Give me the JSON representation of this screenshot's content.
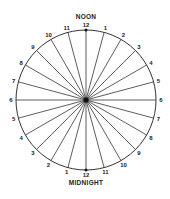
{
  "diagram": {
    "title_top": "NOON",
    "title_bottom": "MIDNIGHT",
    "center": {
      "x": 86,
      "y": 100
    },
    "radius": 70,
    "spoke_count": 24,
    "colors": {
      "line": "#333333",
      "text": "#222222",
      "hub": "#111111"
    },
    "hour_labels": [
      {
        "angle": 0,
        "text": "12"
      },
      {
        "angle": 15,
        "text": "1"
      },
      {
        "angle": 30,
        "text": "2"
      },
      {
        "angle": 45,
        "text": "3"
      },
      {
        "angle": 60,
        "text": "4"
      },
      {
        "angle": 75,
        "text": "5"
      },
      {
        "angle": 90,
        "text": "6"
      },
      {
        "angle": 105,
        "text": "7"
      },
      {
        "angle": 120,
        "text": "8"
      },
      {
        "angle": 135,
        "text": "9"
      },
      {
        "angle": 150,
        "text": "10"
      },
      {
        "angle": 165,
        "text": "11"
      },
      {
        "angle": 180,
        "text": "12"
      },
      {
        "angle": 195,
        "text": "1"
      },
      {
        "angle": 210,
        "text": "2"
      },
      {
        "angle": 225,
        "text": "3"
      },
      {
        "angle": 240,
        "text": "4"
      },
      {
        "angle": 255,
        "text": "5"
      },
      {
        "angle": 270,
        "text": "6"
      },
      {
        "angle": 285,
        "text": "7"
      },
      {
        "angle": 300,
        "text": "8"
      },
      {
        "angle": 315,
        "text": "9"
      },
      {
        "angle": 330,
        "text": "10"
      },
      {
        "angle": 345,
        "text": "11"
      }
    ]
  }
}
